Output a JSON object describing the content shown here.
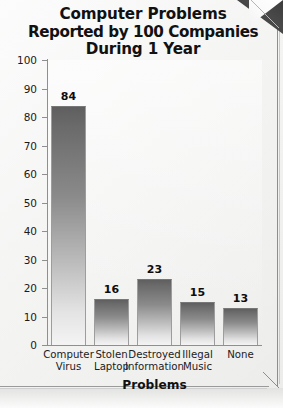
{
  "page": {
    "title_lines": [
      "Computer Problems",
      "Reported by 100 Companies",
      "During 1 Year"
    ],
    "corner_fold": "page-corner-fold"
  },
  "chart_data": {
    "type": "bar",
    "title": "Computer Problems Reported by 100 Companies During 1 Year",
    "categories": [
      "Computer Virus",
      "Stolen Laptop",
      "Destroyed Information",
      "Illegal Music",
      "None"
    ],
    "category_lines": [
      [
        "Computer",
        "Virus"
      ],
      [
        "Stolen",
        "Laptop"
      ],
      [
        "Destroyed",
        "Information"
      ],
      [
        "Illegal",
        "Music"
      ],
      [
        "None",
        ""
      ]
    ],
    "values": [
      84,
      16,
      23,
      15,
      13
    ],
    "value_labels": [
      "84",
      "16",
      "23",
      "15",
      "13"
    ],
    "xlabel": "Problems",
    "ylabel": "",
    "ylim": [
      0,
      100
    ],
    "ytick_labels": [
      "100",
      "90",
      "80",
      "70",
      "60",
      "50",
      "40",
      "30",
      "20",
      "10",
      "0"
    ],
    "ytick_values": [
      100,
      90,
      80,
      70,
      60,
      50,
      40,
      30,
      20,
      10,
      0
    ],
    "grid": false,
    "legend": false,
    "bar_color_top": "#5f5f5f",
    "bar_color_bottom": "#f4f4f4",
    "axis_color": "#8f8f8f",
    "text_color": "#111111"
  }
}
